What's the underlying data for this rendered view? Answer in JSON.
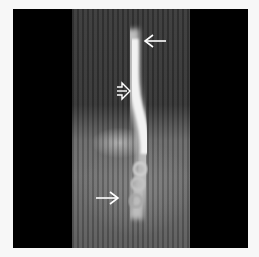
{
  "image": {
    "description": "Barium swallow radiograph of the esophagus",
    "annotations": [
      {
        "type": "arrow",
        "style": "thin",
        "direction": "left",
        "label": "upper arrow"
      },
      {
        "type": "arrow",
        "style": "open-outline",
        "direction": "right",
        "label": "middle open arrow"
      },
      {
        "type": "arrow",
        "style": "thin",
        "direction": "right",
        "label": "lower arrow"
      }
    ],
    "colors": {
      "background": "#f7f7f7",
      "frame": "#000000",
      "arrow": "#ffffff"
    }
  }
}
